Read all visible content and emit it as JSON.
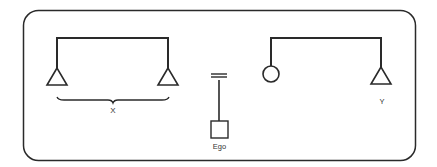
{
  "diagram": {
    "type": "kinship",
    "colors": {
      "stroke": "#2a2a2a",
      "background": "#ffffff"
    },
    "groups": [
      {
        "name": "left-sibling-group",
        "members": [
          {
            "symbol": "triangle",
            "meaning": "male"
          },
          {
            "symbol": "triangle",
            "meaning": "male"
          }
        ],
        "brace_label": "X"
      },
      {
        "name": "ego-group",
        "marriage_symbol": "=",
        "ego": {
          "symbol": "square",
          "label": "Ego"
        }
      },
      {
        "name": "right-sibling-group",
        "members": [
          {
            "symbol": "circle",
            "meaning": "female"
          },
          {
            "symbol": "triangle",
            "meaning": "male",
            "label": "Y"
          }
        ]
      }
    ]
  },
  "labels": {
    "x": "X",
    "ego": "Ego",
    "y": "Y"
  }
}
